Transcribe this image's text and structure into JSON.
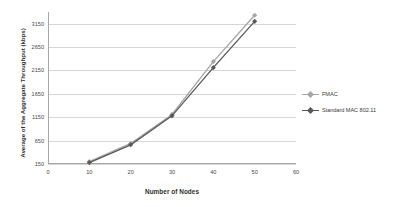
{
  "chart_data": {
    "type": "line",
    "title": "",
    "xlabel": "Number of Nodes",
    "ylabel": "Average of the Aggregate Throughput (kbps)",
    "x": [
      10,
      20,
      30,
      40,
      50
    ],
    "xlim": [
      0,
      60
    ],
    "ylim": [
      150,
      3400
    ],
    "xticks": [
      "0",
      "10",
      "20",
      "30",
      "40",
      "50",
      "60"
    ],
    "yticks": [
      "150",
      "650",
      "1150",
      "1650",
      "2150",
      "2650",
      "3150"
    ],
    "grid": true,
    "legend_position": "right",
    "series": [
      {
        "name": "FMAC",
        "color": "#a6a6a6",
        "marker": "diamond",
        "values": [
          200,
          590,
          1210,
          2340,
          3330
        ]
      },
      {
        "name": "Standard MAC 802.11",
        "color": "#595959",
        "marker": "diamond",
        "values": [
          180,
          560,
          1180,
          2210,
          3200
        ]
      }
    ]
  },
  "legend": {
    "items": [
      {
        "label": "FMAC",
        "color": "#a6a6a6"
      },
      {
        "label": "Standard MAC 802.11",
        "color": "#595959"
      }
    ]
  },
  "axes": {
    "x_title": "Number of Nodes",
    "y_title": "Average of the Aggregate Throughput (kbps)"
  }
}
